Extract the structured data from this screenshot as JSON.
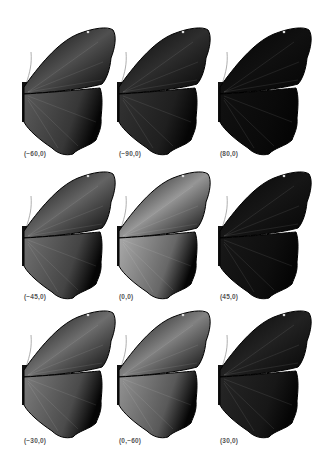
{
  "figure": {
    "panels": [
      {
        "label": "(−60,0)",
        "brightness": 0.35,
        "highlight": "forewing-streak"
      },
      {
        "label": "(−90,0)",
        "brightness": 0.18,
        "highlight": "faint-veins"
      },
      {
        "label": "(80,0)",
        "brightness": 0.03,
        "highlight": "none"
      },
      {
        "label": "(−45,0)",
        "brightness": 0.45,
        "highlight": "diffuse"
      },
      {
        "label": "(0,0)",
        "brightness": 0.7,
        "highlight": "hindwing-bright"
      },
      {
        "label": "(45,0)",
        "brightness": 0.06,
        "highlight": "hindwing-edge"
      },
      {
        "label": "(−30,0)",
        "brightness": 0.5,
        "highlight": "uniform-gray"
      },
      {
        "label": "(0,−60)",
        "brightness": 0.6,
        "highlight": "forewing-stripes"
      },
      {
        "label": "(30,0)",
        "brightness": 0.12,
        "highlight": "hindwing-streaks"
      }
    ]
  },
  "colors": {
    "background": "#ffffff",
    "wing_dark": "#050505",
    "label": "#555555"
  }
}
